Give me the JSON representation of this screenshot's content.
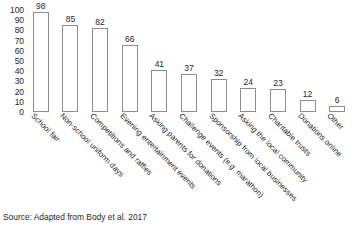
{
  "chart_data": {
    "type": "bar",
    "title": "",
    "xlabel": "",
    "ylabel": "",
    "ylim": [
      0,
      100
    ],
    "grid": false,
    "legend": false,
    "categories": [
      "School fair",
      "Non-school uniform days",
      "Competitions and raffles",
      "Evening entertainment events",
      "Asking parents for donations",
      "Challenge events (e.g. marathon)",
      "Sponsorship from local businesses",
      "Asking the local community",
      "Charitable trusts",
      "Donations online",
      "Other"
    ],
    "values": [
      98,
      85,
      82,
      66,
      41,
      37,
      32,
      24,
      23,
      12,
      6
    ],
    "y_ticks": [
      100,
      90,
      80,
      70,
      60,
      50,
      40,
      30,
      20,
      10,
      0
    ],
    "bar_fill": "#ffffff",
    "bar_stroke": "#8d8d8d",
    "label_rotation_deg": 45
  },
  "source": {
    "text": "Source: Adapted from Body et al. 2017"
  }
}
